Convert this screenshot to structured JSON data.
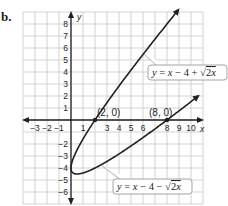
{
  "problem_label": "b.",
  "chart_data": {
    "type": "line",
    "title": "",
    "xlabel": "x",
    "ylabel": "y",
    "xlim": [
      -4,
      11
    ],
    "ylim": [
      -7,
      9
    ],
    "grid": true,
    "x_tick_labels": [
      "−3",
      "−2",
      "−1",
      "1",
      "3",
      "4",
      "5",
      "6",
      "8",
      "9",
      "10"
    ],
    "y_tick_labels": [
      "8",
      "7",
      "6",
      "5",
      "4",
      "3",
      "2",
      "1",
      "−2",
      "−3",
      "−4",
      "−5",
      "−6"
    ],
    "series": [
      {
        "name": "y = x − 4 + √2x",
        "label": "y = x − 4 + √2x",
        "domain": [
          0,
          10
        ]
      },
      {
        "name": "y = x − 4 − √2x",
        "label": "y = x − 4 − √2x",
        "domain": [
          0,
          10.5
        ]
      }
    ],
    "annotations": [
      {
        "text": "(2, 0)",
        "x": 2,
        "y": 0
      },
      {
        "text": "(8, 0)",
        "x": 8,
        "y": 0
      }
    ],
    "colors": {
      "grid": "#c8c8c8",
      "axis": "#231f20",
      "curve": "#231f20",
      "box_border": "#9a9a9a"
    }
  }
}
